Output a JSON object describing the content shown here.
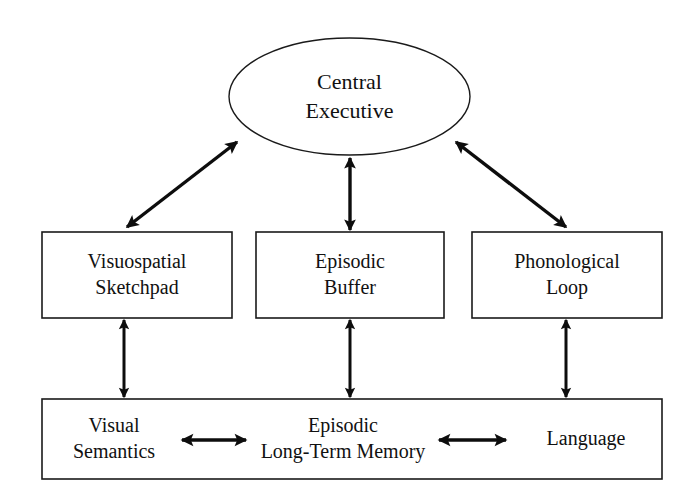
{
  "diagram": {
    "type": "block-diagram",
    "background_color": "#ffffff",
    "stroke_color": "#111111",
    "fill_color": "#ffffff"
  },
  "nodes": {
    "central_executive": {
      "id": "central-executive",
      "shape": "ellipse",
      "line1": "Central",
      "line2": "Executive"
    },
    "visuospatial_sketchpad": {
      "id": "visuospatial-sketchpad",
      "shape": "rectangle",
      "line1": "Visuospatial",
      "line2": "Sketchpad"
    },
    "episodic_buffer": {
      "id": "episodic-buffer",
      "shape": "rectangle",
      "line1": "Episodic",
      "line2": "Buffer"
    },
    "phonological_loop": {
      "id": "phonological-loop",
      "shape": "rectangle",
      "line1": "Phonological",
      "line2": "Loop"
    },
    "visual_semantics": {
      "id": "visual-semantics",
      "shape": "text",
      "line1": "Visual",
      "line2": "Semantics"
    },
    "episodic_ltm": {
      "id": "episodic-long-term-memory",
      "shape": "text",
      "line1": "Episodic",
      "line2": "Long-Term Memory"
    },
    "language": {
      "id": "language",
      "shape": "text",
      "line1": "Language",
      "line2": ""
    }
  },
  "connectors": [
    {
      "id": "ce-to-sketchpad",
      "from": "central-executive",
      "to": "visuospatial-sketchpad",
      "direction": "bidirectional",
      "orientation": "diagonal"
    },
    {
      "id": "ce-to-episodic-buffer",
      "from": "central-executive",
      "to": "episodic-buffer",
      "direction": "bidirectional",
      "orientation": "vertical"
    },
    {
      "id": "ce-to-phonological-loop",
      "from": "central-executive",
      "to": "phonological-loop",
      "direction": "bidirectional",
      "orientation": "diagonal"
    },
    {
      "id": "sketchpad-to-visual-semantics",
      "from": "visuospatial-sketchpad",
      "to": "visual-semantics",
      "direction": "bidirectional",
      "orientation": "vertical"
    },
    {
      "id": "buffer-to-episodic-ltm",
      "from": "episodic-buffer",
      "to": "episodic-long-term-memory",
      "direction": "bidirectional",
      "orientation": "vertical"
    },
    {
      "id": "loop-to-language",
      "from": "phonological-loop",
      "to": "language",
      "direction": "bidirectional",
      "orientation": "vertical"
    },
    {
      "id": "visual-semantics-to-episodic-ltm",
      "from": "visual-semantics",
      "to": "episodic-long-term-memory",
      "direction": "bidirectional",
      "orientation": "horizontal"
    },
    {
      "id": "episodic-ltm-to-language",
      "from": "episodic-long-term-memory",
      "to": "language",
      "direction": "bidirectional",
      "orientation": "horizontal"
    }
  ]
}
